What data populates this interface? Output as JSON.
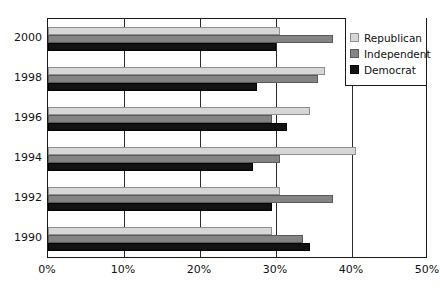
{
  "chart_data": {
    "type": "bar",
    "orientation": "horizontal",
    "title": "",
    "xlabel": "",
    "ylabel": "",
    "categories": [
      "2000",
      "1998",
      "1996",
      "1994",
      "1992",
      "1990"
    ],
    "series": [
      {
        "name": "Republican",
        "color": "#d6d6d6",
        "values": [
          30.5,
          36.5,
          34.5,
          40.5,
          30.5,
          29.5
        ]
      },
      {
        "name": "Independent",
        "color": "#848484",
        "values": [
          37.5,
          35.5,
          29.5,
          30.5,
          37.5,
          33.5
        ]
      },
      {
        "name": "Democrat",
        "color": "#121212",
        "values": [
          30.0,
          27.5,
          31.5,
          27.0,
          29.5,
          34.5
        ]
      }
    ],
    "xlim": [
      0,
      50
    ],
    "xticks": [
      0,
      10,
      20,
      30,
      40,
      50
    ],
    "xtick_labels": [
      "0%",
      "10%",
      "20%",
      "30%",
      "40%",
      "50%"
    ],
    "grid": true,
    "grid_axis": "x",
    "legend_position": "right-top",
    "legend": [
      {
        "label": "Republican",
        "color": "#d6d6d6"
      },
      {
        "label": "Independent",
        "color": "#848484"
      },
      {
        "label": "Democrat",
        "color": "#121212"
      }
    ]
  }
}
